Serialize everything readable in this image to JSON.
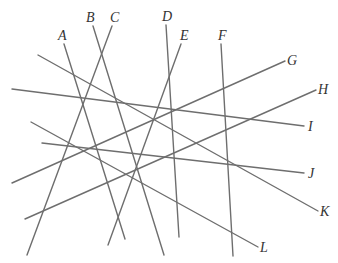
{
  "diagram": {
    "title": "",
    "line_color": "#6e6e6e",
    "label_color": "#333333",
    "lines": [
      {
        "label": "A",
        "x1": 64,
        "y1": 44,
        "x2": 125,
        "y2": 239,
        "lx": 58,
        "ly": 40
      },
      {
        "label": "B",
        "x1": 93,
        "y1": 26,
        "x2": 164,
        "y2": 255,
        "lx": 86,
        "ly": 22
      },
      {
        "label": "C",
        "x1": 112,
        "y1": 26,
        "x2": 27,
        "y2": 255,
        "lx": 110,
        "ly": 22
      },
      {
        "label": "D",
        "x1": 166,
        "y1": 25,
        "x2": 179,
        "y2": 237,
        "lx": 162,
        "ly": 21
      },
      {
        "label": "E",
        "x1": 181,
        "y1": 44,
        "x2": 108,
        "y2": 245,
        "lx": 180,
        "ly": 40
      },
      {
        "label": "F",
        "x1": 221,
        "y1": 44,
        "x2": 233,
        "y2": 256,
        "lx": 218,
        "ly": 40
      },
      {
        "label": "G",
        "x1": 285,
        "y1": 61,
        "x2": 12,
        "y2": 183,
        "lx": 287,
        "ly": 65
      },
      {
        "label": "H",
        "x1": 316,
        "y1": 90,
        "x2": 25,
        "y2": 219,
        "lx": 318,
        "ly": 94
      },
      {
        "label": "I",
        "x1": 304,
        "y1": 126,
        "x2": 12,
        "y2": 89,
        "lx": 308,
        "ly": 131
      },
      {
        "label": "J",
        "x1": 304,
        "y1": 173,
        "x2": 42,
        "y2": 143,
        "lx": 308,
        "ly": 178
      },
      {
        "label": "K",
        "x1": 318,
        "y1": 211,
        "x2": 38,
        "y2": 55,
        "lx": 320,
        "ly": 216
      },
      {
        "label": "L",
        "x1": 258,
        "y1": 247,
        "x2": 31,
        "y2": 122,
        "lx": 260,
        "ly": 252
      }
    ]
  }
}
